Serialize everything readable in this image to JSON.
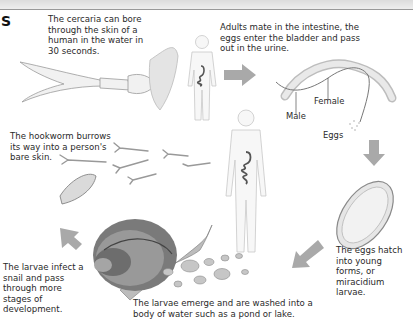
{
  "header": {
    "title_fragment": "S"
  },
  "captions": {
    "cercaria": [
      "The cercaria can bore",
      "through the skin of a",
      "human in the water in",
      "30 seconds."
    ],
    "adults": [
      "Adults mate in the intestine, the",
      "eggs enter the bladder and pass",
      "out in the urine."
    ],
    "hookworm": [
      "The hookworm burrows",
      "its way into a person's",
      "bare skin."
    ],
    "snail": [
      "The larvae infect a",
      "snail and pass",
      "through more",
      "stages of",
      "development."
    ],
    "emerge": [
      "The larvae emerge and are washed into a",
      "body of water such as a pond or lake."
    ],
    "hatch": [
      "The eggs hatch",
      "into young",
      "forms, or",
      "miracidium",
      "larvae."
    ]
  },
  "labels": {
    "male": "Male",
    "female": "Female",
    "eggs": "Eggs"
  },
  "colors": {
    "arrow": "#a9a9a9",
    "human_outline": "#c8c8c8",
    "organ": "#555555",
    "text": "#2a2a2a"
  }
}
